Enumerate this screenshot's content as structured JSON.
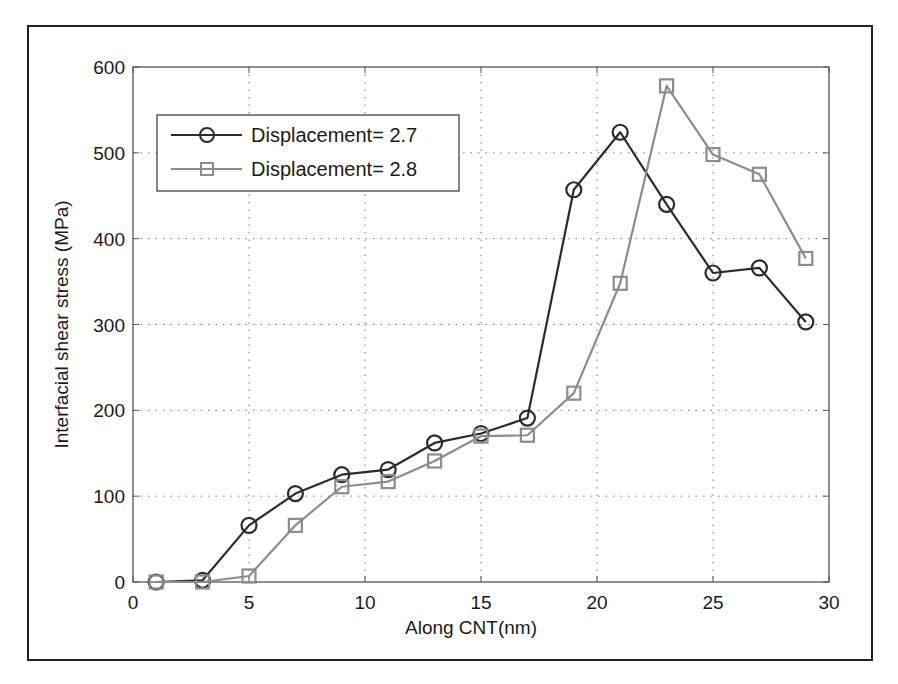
{
  "chart_data": {
    "type": "line",
    "title": "",
    "xlabel": "Along CNT(nm)",
    "ylabel": "Interfacial shear stress (MPa)",
    "xlim": [
      0,
      30
    ],
    "ylim": [
      0,
      600
    ],
    "xticks": [
      0,
      5,
      10,
      15,
      20,
      25,
      30
    ],
    "yticks": [
      0,
      100,
      200,
      300,
      400,
      500,
      600
    ],
    "grid": true,
    "legend_position": "upper left",
    "x": [
      1,
      3,
      5,
      7,
      9,
      11,
      13,
      15,
      17,
      19,
      21,
      23,
      25,
      27,
      29
    ],
    "series": [
      {
        "name": "Displacement= 2.7",
        "marker": "circle",
        "color": "#2b2b2b",
        "values": [
          0,
          2,
          66,
          103,
          125,
          131,
          162,
          173,
          191,
          457,
          524,
          440,
          360,
          366,
          303
        ]
      },
      {
        "name": "Displacement= 2.8",
        "marker": "square",
        "color": "#8c8c8c",
        "values": [
          0,
          0,
          7,
          66,
          111,
          117,
          141,
          170,
          171,
          220,
          348,
          578,
          498,
          475,
          377
        ]
      }
    ]
  },
  "legend": {
    "items": [
      {
        "label": "Displacement= 2.7"
      },
      {
        "label": "Displacement= 2.8"
      }
    ]
  },
  "axes": {
    "xlabel": "Along CNT(nm)",
    "ylabel": "Interfacial shear stress (MPa)"
  }
}
